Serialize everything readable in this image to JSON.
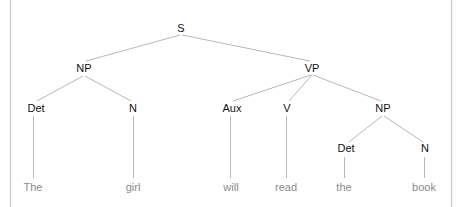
{
  "diagram": {
    "type": "syntax-tree",
    "sentence": "The girl will read the book",
    "colors": {
      "edge": "#b8b8b8",
      "label": "#111111",
      "leaf": "#8a8a8a",
      "border": "#cfcfcf"
    },
    "nodes": {
      "S": {
        "label": "S"
      },
      "NP1": {
        "label": "NP"
      },
      "VP": {
        "label": "VP"
      },
      "Det1": {
        "label": "Det"
      },
      "N1": {
        "label": "N"
      },
      "Aux": {
        "label": "Aux"
      },
      "V": {
        "label": "V"
      },
      "NP2": {
        "label": "NP"
      },
      "Det2": {
        "label": "Det"
      },
      "N2": {
        "label": "N"
      }
    },
    "leaves": {
      "the1": {
        "label": "The"
      },
      "girl": {
        "label": "girl"
      },
      "will": {
        "label": "will"
      },
      "read": {
        "label": "read"
      },
      "the2": {
        "label": "the"
      },
      "book": {
        "label": "book"
      }
    },
    "edges": [
      [
        "S",
        "NP1"
      ],
      [
        "S",
        "VP"
      ],
      [
        "NP1",
        "Det1"
      ],
      [
        "NP1",
        "N1"
      ],
      [
        "VP",
        "Aux"
      ],
      [
        "VP",
        "V"
      ],
      [
        "VP",
        "NP2"
      ],
      [
        "NP2",
        "Det2"
      ],
      [
        "NP2",
        "N2"
      ],
      [
        "Det1",
        "the1"
      ],
      [
        "N1",
        "girl"
      ],
      [
        "Aux",
        "will"
      ],
      [
        "V",
        "read"
      ],
      [
        "Det2",
        "the2"
      ],
      [
        "N2",
        "book"
      ]
    ]
  }
}
